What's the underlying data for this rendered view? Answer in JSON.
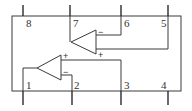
{
  "diagram": {
    "type": "dual op-amp IC pinout",
    "colors": {
      "line": "#3a3a3a",
      "background": "#ffffff"
    },
    "pins_top": [
      {
        "number": "8",
        "x": 23
      },
      {
        "number": "7",
        "x": 70
      },
      {
        "number": "6",
        "x": 121
      },
      {
        "number": "5",
        "x": 168
      }
    ],
    "pins_bottom": [
      {
        "number": "1",
        "x": 23
      },
      {
        "number": "2",
        "x": 72
      },
      {
        "number": "3",
        "x": 121
      },
      {
        "number": "4",
        "x": 168
      }
    ],
    "opamps": [
      {
        "name": "upper",
        "output_pin": "7",
        "inverting_pin": "6",
        "noninverting_pin": "5",
        "minus_label": "−",
        "plus_label": "+"
      },
      {
        "name": "lower",
        "output_pin": "1",
        "inverting_pin": "2",
        "noninverting_pin": "3",
        "minus_label": "−",
        "plus_label": "+"
      }
    ]
  }
}
